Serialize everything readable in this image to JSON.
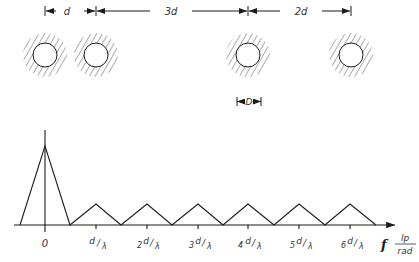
{
  "dimensions": {
    "spacing_labels": [
      "d",
      "3d",
      "2d"
    ],
    "aperture_label": "D"
  },
  "axis": {
    "variable": "f",
    "unit_numerator": "lp",
    "unit_denominator": "rad",
    "tick_labels": [
      {
        "coef": "",
        "num": "0",
        "den": ""
      },
      {
        "coef": "",
        "num": "d",
        "den": "λ"
      },
      {
        "coef": "2",
        "num": "d",
        "den": "λ"
      },
      {
        "coef": "3",
        "num": "d",
        "den": "λ"
      },
      {
        "coef": "4",
        "num": "d",
        "den": "λ"
      },
      {
        "coef": "5",
        "num": "d",
        "den": "λ"
      },
      {
        "coef": "6",
        "num": "d",
        "den": "λ"
      }
    ]
  },
  "colors": {
    "ink": "#1a1a1a",
    "label": "#333333",
    "background": "#ffffff"
  }
}
